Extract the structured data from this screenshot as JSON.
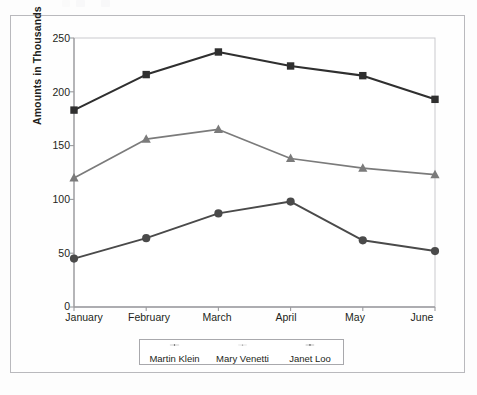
{
  "chart_data": {
    "type": "line",
    "title": "",
    "xlabel": "",
    "ylabel": "Amounts in Thousands",
    "categories": [
      "January",
      "February",
      "March",
      "April",
      "May",
      "June"
    ],
    "ylim": [
      0,
      250
    ],
    "yticks": [
      0,
      50,
      100,
      150,
      200,
      250
    ],
    "ytick_labels": [
      "0",
      "50",
      "100",
      "150",
      "200",
      "250"
    ],
    "grid": false,
    "legend_position": "bottom",
    "series": [
      {
        "name": "Martin Klein",
        "marker": "circle",
        "color": "#4a4a4a",
        "values": [
          45,
          64,
          87,
          98,
          62,
          52
        ]
      },
      {
        "name": "Mary Venetti",
        "marker": "triangle",
        "color": "#7b7b7b",
        "values": [
          120,
          156,
          165,
          138,
          129,
          123
        ]
      },
      {
        "name": "Janet Loo",
        "marker": "square",
        "color": "#2f2f2f",
        "values": [
          183,
          216,
          237,
          224,
          215,
          193
        ]
      }
    ]
  },
  "axis": {
    "y_title": "Amounts in Thousands",
    "y_tick_0": "0",
    "y_tick_1": "50",
    "y_tick_2": "100",
    "y_tick_3": "150",
    "y_tick_4": "200",
    "y_tick_5": "250",
    "x_tick_0": "January",
    "x_tick_1": "February",
    "x_tick_2": "March",
    "x_tick_3": "April",
    "x_tick_4": "May",
    "x_tick_5": "June"
  },
  "legend": {
    "items": [
      {
        "label": "Martin Klein",
        "marker": "circle-marker",
        "color": "#4a4a4a"
      },
      {
        "label": "Mary Venetti",
        "marker": "triangle-marker",
        "color": "#7b7b7b"
      },
      {
        "label": "Janet Loo",
        "marker": "square-marker",
        "color": "#2f2f2f"
      }
    ]
  },
  "colors": {
    "frame_border": "#b9b9bd",
    "axis_line": "#9b9b9f",
    "page_background": "#fdfdfd",
    "plot_background": "#ffffff"
  }
}
